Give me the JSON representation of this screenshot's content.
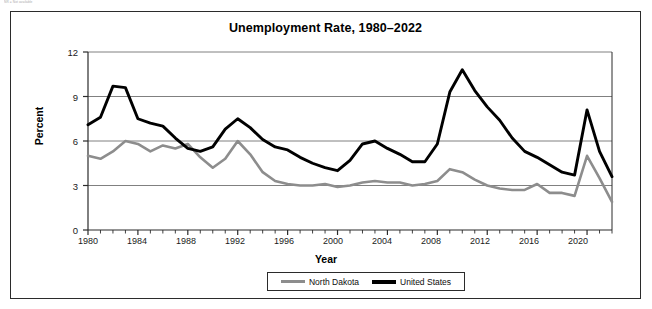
{
  "top_note": "NR = Not available",
  "figure": {
    "title": "Unemployment Rate, 1980–2022"
  },
  "axes": {
    "ylabel": "Percent",
    "xlabel": "Year",
    "y_ticks": [
      "0",
      "3",
      "6",
      "9",
      "12"
    ],
    "x_ticks": [
      "1980",
      "1984",
      "1988",
      "1992",
      "1996",
      "2000",
      "2004",
      "2008",
      "2012",
      "2016",
      "2020"
    ]
  },
  "legend": {
    "items": [
      {
        "label": "North Dakota",
        "color": "#8d8d8d"
      },
      {
        "label": "United States",
        "color": "#000000"
      }
    ]
  },
  "colors": {
    "north_dakota": "#8d8d8d",
    "united_states": "#000000",
    "gridline": "#808080",
    "axis": "#2b2b2b"
  },
  "chart_data": {
    "type": "line",
    "title": "Unemployment Rate, 1980–2022",
    "xlabel": "Year",
    "ylabel": "Percent",
    "xlim": [
      1980,
      2022
    ],
    "ylim": [
      0,
      12
    ],
    "ytick_values": [
      0,
      3,
      6,
      9,
      12
    ],
    "xtick_values": [
      1980,
      1984,
      1988,
      1992,
      1996,
      2000,
      2004,
      2008,
      2012,
      2016,
      2020
    ],
    "grid": "horizontal",
    "legend_position": "bottom",
    "x": [
      1980,
      1981,
      1982,
      1983,
      1984,
      1985,
      1986,
      1987,
      1988,
      1989,
      1990,
      1991,
      1992,
      1993,
      1994,
      1995,
      1996,
      1997,
      1998,
      1999,
      2000,
      2001,
      2002,
      2003,
      2004,
      2005,
      2006,
      2007,
      2008,
      2009,
      2010,
      2011,
      2012,
      2013,
      2014,
      2015,
      2016,
      2017,
      2018,
      2019,
      2020,
      2021,
      2022
    ],
    "series": [
      {
        "name": "United States",
        "color": "#000000",
        "values": [
          7.1,
          7.6,
          9.7,
          9.6,
          7.5,
          7.2,
          7.0,
          6.2,
          5.5,
          5.3,
          5.6,
          6.8,
          7.5,
          6.9,
          6.1,
          5.6,
          5.4,
          4.9,
          4.5,
          4.2,
          4.0,
          4.7,
          5.8,
          6.0,
          5.5,
          5.1,
          4.6,
          4.6,
          5.8,
          9.3,
          10.8,
          9.4,
          8.3,
          7.4,
          6.2,
          5.3,
          4.9,
          4.4,
          3.9,
          3.7,
          8.1,
          5.3,
          3.6
        ]
      },
      {
        "name": "North Dakota",
        "color": "#8d8d8d",
        "values": [
          5.0,
          4.8,
          5.3,
          6.0,
          5.8,
          5.3,
          5.7,
          5.5,
          5.8,
          4.9,
          4.2,
          4.8,
          6.0,
          5.1,
          3.9,
          3.3,
          3.1,
          3.0,
          3.0,
          3.1,
          2.9,
          3.0,
          3.2,
          3.3,
          3.2,
          3.2,
          3.0,
          3.1,
          3.3,
          4.1,
          3.9,
          3.4,
          3.0,
          2.8,
          2.7,
          2.7,
          3.1,
          2.5,
          2.5,
          2.3,
          5.0,
          3.5,
          1.9
        ]
      }
    ]
  }
}
